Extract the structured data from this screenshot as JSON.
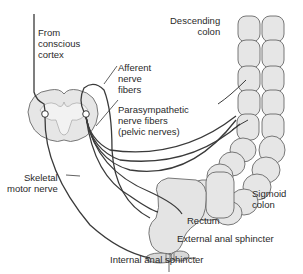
{
  "diagram": {
    "labels": {
      "from_cortex": "From\nconscious\ncortex",
      "afferent": "Afferent\nnerve\nfibers",
      "parasympathetic": "Parasympathetic\nnerve fibers\n(pelvic nerves)",
      "descending_colon": "Descending\ncolon",
      "sigmoid_colon": "Sigmoid\ncolon",
      "skeletal_motor": "Skeletal\nmotor nerve",
      "rectum": "Rectum",
      "external_sphincter": "External anal sphincter",
      "internal_sphincter": "Internal anal sphincter"
    },
    "structures": [
      "spinal-cord-cross-section",
      "descending-colon",
      "sigmoid-colon",
      "rectum",
      "external-anal-sphincter",
      "internal-anal-sphincter"
    ],
    "colors": {
      "tissue_fill": "#e4e4e4",
      "tissue_stroke": "#6a6a6a",
      "nerve": "#3a3a3a",
      "text": "#2a2a2a",
      "background": "#ffffff"
    }
  }
}
